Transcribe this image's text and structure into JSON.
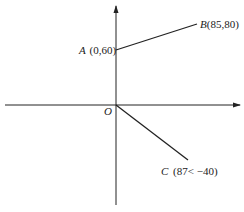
{
  "diagram": {
    "origin_label": "O",
    "points": [
      {
        "name": "A",
        "coords": "(0,60)"
      },
      {
        "name": "B",
        "coords": "(85,80)"
      },
      {
        "name": "C",
        "coords": "(87< −40)"
      }
    ],
    "colors": {
      "line": "#222222",
      "background": "#ffffff"
    }
  }
}
